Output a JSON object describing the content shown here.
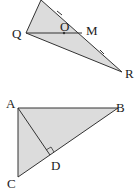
{
  "colors": {
    "fill": "#dcdcdc",
    "stroke": "#333333"
  },
  "figure1": {
    "labels": {
      "Q": "Q",
      "O": "O",
      "M": "M",
      "R": "R"
    }
  },
  "figure2": {
    "labels": {
      "A": "A",
      "B": "B",
      "C": "C",
      "D": "D"
    }
  }
}
